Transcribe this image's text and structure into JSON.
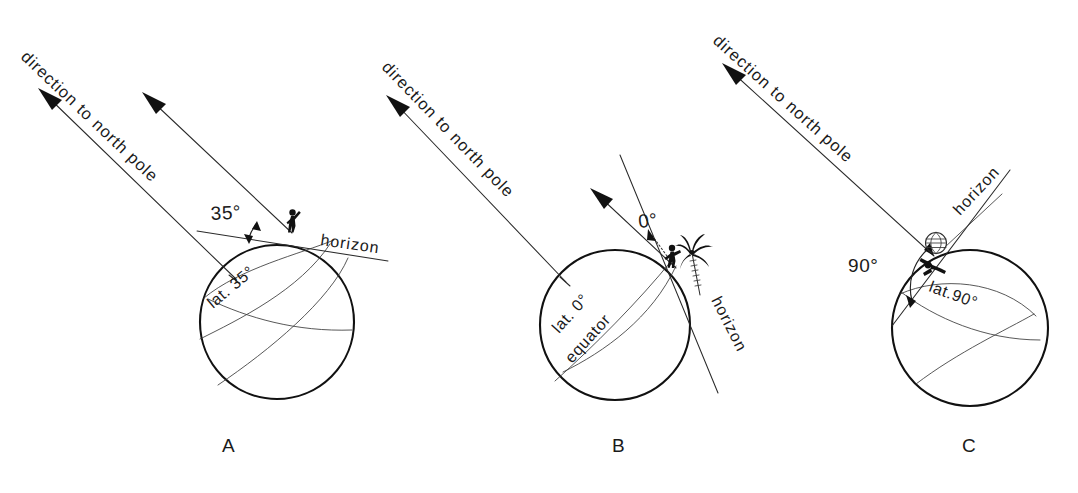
{
  "figure": {
    "background_color": "#ffffff",
    "ink_color": "#111111",
    "width": 1078,
    "height": 493
  },
  "panels": [
    {
      "id": "A",
      "caption": "A",
      "latitude_degrees": 35,
      "pole_direction_label": "direction to north pole",
      "pole_direction_label_2": "direction to north pole",
      "angle_label": "35°",
      "horizon_label": "horizon",
      "latitude_label": "lat. 35°",
      "observer": "person-figure",
      "scene_props": []
    },
    {
      "id": "B",
      "caption": "B",
      "latitude_degrees": 0,
      "pole_direction_label": "direction to north pole",
      "angle_label": "0°",
      "horizon_label": "horizon",
      "latitude_label": "lat. 0°",
      "equator_label": "equator",
      "observer": "person-figure",
      "scene_props": [
        "palm-tree"
      ]
    },
    {
      "id": "C",
      "caption": "C",
      "latitude_degrees": 90,
      "pole_direction_label": "direction to north pole",
      "angle_label": "90°",
      "horizon_label": "horizon",
      "latitude_label": "lat.90°",
      "observer": "person-figure",
      "scene_props": [
        "small-globe"
      ]
    }
  ],
  "globes": [
    {
      "id": "A",
      "cx": 277,
      "cy": 322,
      "r": 77
    },
    {
      "id": "B",
      "cx": 615,
      "cy": 325,
      "r": 75
    },
    {
      "id": "C",
      "cx": 970,
      "cy": 328,
      "r": 78
    }
  ]
}
